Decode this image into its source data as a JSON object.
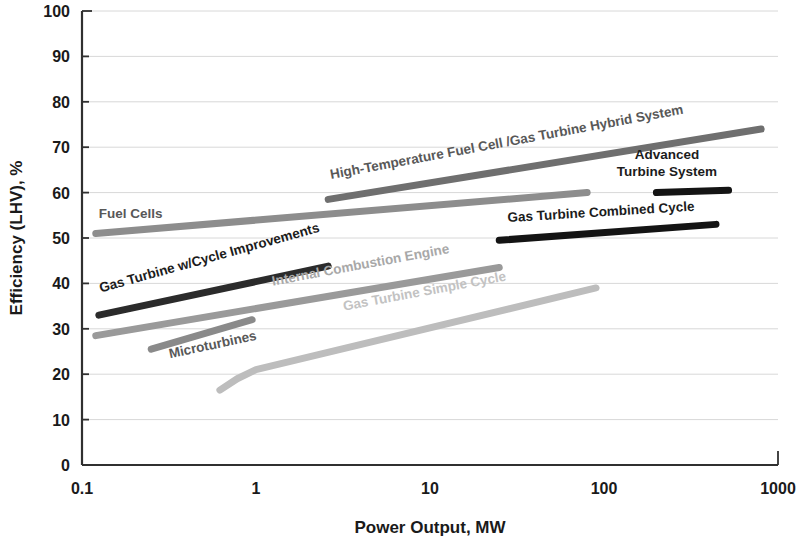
{
  "chart_data": {
    "type": "line",
    "title": "",
    "xlabel": "Power Output, MW",
    "ylabel": "Efficiency (LHV), %",
    "xscale": "log",
    "xlim": [
      0.1,
      1000
    ],
    "ylim": [
      0,
      100
    ],
    "xticks": [
      "0.1",
      "1",
      "10",
      "100",
      "1000"
    ],
    "xtick_values": [
      0.1,
      1,
      10,
      100,
      1000
    ],
    "yticks": [
      "0",
      "10",
      "20",
      "30",
      "40",
      "50",
      "60",
      "70",
      "80",
      "90",
      "100"
    ],
    "ytick_values": [
      0,
      10,
      20,
      30,
      40,
      50,
      60,
      70,
      80,
      90,
      100
    ],
    "grid": true,
    "grid_axis": "y",
    "legend": "inline-labels",
    "series": [
      {
        "name": "Fuel Cells",
        "label": "Fuel Cells",
        "color": "#8d8d8d",
        "tone": "mid",
        "width": 7,
        "points": [
          [
            0.12,
            51.0
          ],
          [
            80,
            60.0
          ]
        ],
        "label_x": 0.125,
        "label_y": 54.5,
        "label_angle": 0
      },
      {
        "name": "High-Temperature Fuel Cell / Gas Turbine Hybrid System",
        "label": "High-Temperature Fuel Cell /Gas Turbine Hybrid System",
        "color": "#6f6f6f",
        "tone": "mid",
        "width": 7,
        "points": [
          [
            2.6,
            58.5
          ],
          [
            800,
            74.0
          ]
        ],
        "label_x": 2.7,
        "label_y": 63.0,
        "label_angle": -10.5
      },
      {
        "name": "Advanced Turbine System",
        "label": "Advanced\nTurbine System",
        "color": "#141414",
        "tone": "dark",
        "width": 7,
        "points": [
          [
            200,
            60.0
          ],
          [
            520,
            60.5
          ]
        ],
        "label_x": 230,
        "label_y": 67.5,
        "label_angle": 0
      },
      {
        "name": "Gas Turbine Combined Cycle",
        "label": "Gas Turbine Combined Cycle",
        "color": "#141414",
        "tone": "dark",
        "width": 7,
        "points": [
          [
            25,
            49.5
          ],
          [
            440,
            53.0
          ]
        ],
        "label_x": 28,
        "label_y": 53.5,
        "label_angle": -3.5
      },
      {
        "name": "Gas Turbine w/Cycle Improvements",
        "label": "Gas Turbine w/Cycle Improvements",
        "color": "#2b2b2b",
        "tone": "dark",
        "width": 7,
        "points": [
          [
            0.125,
            33.0
          ],
          [
            2.6,
            43.8
          ]
        ],
        "label_x": 0.128,
        "label_y": 38.0,
        "label_angle": -15.5
      },
      {
        "name": "Internal Combustion Engine",
        "label": "Internal Combustion Engine",
        "color": "#9a9a9a",
        "tone": "light",
        "width": 7,
        "points": [
          [
            0.12,
            28.5
          ],
          [
            25,
            43.5
          ]
        ],
        "label_x": 1.25,
        "label_y": 39.5,
        "label_angle": -10.5
      },
      {
        "name": "Microturbines",
        "label": "Microturbines",
        "color": "#8a8a8a",
        "tone": "mid",
        "width": 7,
        "points": [
          [
            0.25,
            25.5
          ],
          [
            0.95,
            32.0
          ]
        ],
        "label_x": 0.32,
        "label_y": 23.5,
        "label_angle": -12
      },
      {
        "name": "Gas Turbine Simple Cycle",
        "label": "Gas Turbine Simple Cycle",
        "color": "#bdbdbd",
        "tone": "pale",
        "width": 7,
        "points": [
          [
            0.62,
            16.5
          ],
          [
            0.78,
            19.0
          ],
          [
            1.0,
            21.0
          ],
          [
            90,
            39.0
          ]
        ],
        "label_x": 3.2,
        "label_y": 34.0,
        "label_angle": -10.5
      }
    ]
  }
}
